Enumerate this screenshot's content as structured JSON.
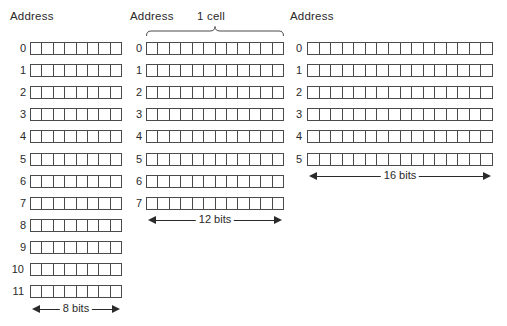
{
  "diagram": {
    "organizations": [
      {
        "address_label": "Address",
        "cell_bits": 8,
        "addresses": [
          "0",
          "1",
          "2",
          "3",
          "4",
          "5",
          "6",
          "7",
          "8",
          "9",
          "10",
          "11"
        ],
        "width_label": "8 bits"
      },
      {
        "address_label": "Address",
        "cell_label": "1 cell",
        "cell_bits": 12,
        "addresses": [
          "0",
          "1",
          "2",
          "3",
          "4",
          "5",
          "6",
          "7"
        ],
        "width_label": "12 bits"
      },
      {
        "address_label": "Address",
        "cell_bits": 16,
        "addresses": [
          "0",
          "1",
          "2",
          "3",
          "4",
          "5"
        ],
        "width_label": "16 bits"
      }
    ]
  },
  "colors": {
    "stroke": "#4a4a4a",
    "text": "#2a2a2a",
    "background": "#ffffff"
  }
}
